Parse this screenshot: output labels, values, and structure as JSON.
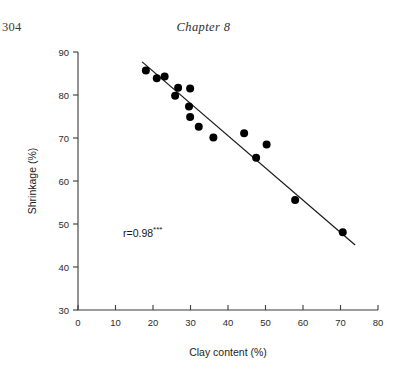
{
  "page": {
    "folio": "304",
    "running_head": "Chapter 8"
  },
  "chart_data": {
    "type": "scatter",
    "title": "",
    "xlabel": "Clay content (%)",
    "ylabel": "Shrinkage (%)",
    "xlim": [
      0,
      80
    ],
    "ylim": [
      30,
      90
    ],
    "xticks": [
      0,
      10,
      20,
      30,
      40,
      50,
      60,
      70,
      80
    ],
    "yticks": [
      30,
      40,
      50,
      60,
      70,
      80,
      90
    ],
    "xtick_labels": [
      "0",
      "10",
      "20",
      "30",
      "40",
      "50",
      "60",
      "70",
      "80"
    ],
    "ytick_labels": [
      "30",
      "40",
      "50",
      "60",
      "70",
      "80",
      "90"
    ],
    "grid": false,
    "legend": false,
    "marker": "filled-circle",
    "marker_color": "#000000",
    "points": [
      {
        "x": 18.1,
        "y": 85.7
      },
      {
        "x": 21.0,
        "y": 83.9
      },
      {
        "x": 23.1,
        "y": 84.3
      },
      {
        "x": 26.7,
        "y": 81.7
      },
      {
        "x": 25.9,
        "y": 79.8
      },
      {
        "x": 29.9,
        "y": 81.5
      },
      {
        "x": 29.6,
        "y": 77.3
      },
      {
        "x": 29.9,
        "y": 74.9
      },
      {
        "x": 32.2,
        "y": 72.6
      },
      {
        "x": 36.1,
        "y": 70.1
      },
      {
        "x": 44.3,
        "y": 71.1
      },
      {
        "x": 47.5,
        "y": 65.4
      },
      {
        "x": 50.3,
        "y": 68.5
      },
      {
        "x": 57.9,
        "y": 55.6
      },
      {
        "x": 70.6,
        "y": 48.1
      }
    ],
    "fit_line": {
      "x_start": 17.1,
      "y_start": 87.7,
      "x_end": 73.9,
      "y_end": 45.1,
      "color": "#1a1a1a"
    },
    "annotations": [
      {
        "name": "correlation-annotation",
        "text": "r=0.98",
        "superscript": "***",
        "x": 12.0,
        "y": 47.0
      }
    ]
  }
}
